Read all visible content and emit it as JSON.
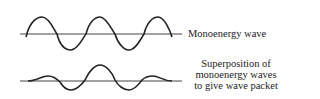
{
  "diagram": {
    "top": {
      "label": "Monoenergy wave",
      "description": "single-frequency sinusoid, constant amplitude"
    },
    "bottom": {
      "label_lines": [
        "Superposition of",
        "monoenergy waves",
        "to give wave packet"
      ],
      "description": "wave packet with amplitude peaking at center"
    },
    "colors": {
      "line": "#222222",
      "axis": "#444444"
    }
  }
}
